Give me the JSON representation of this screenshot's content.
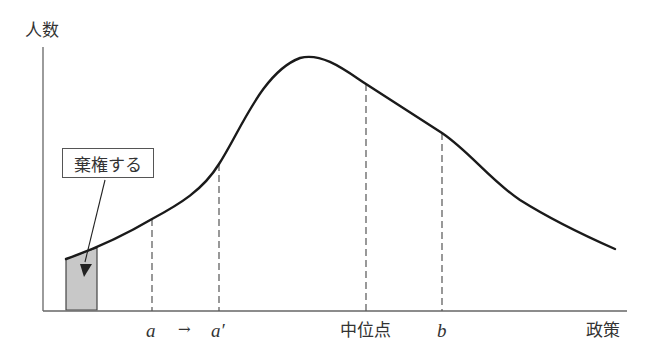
{
  "diagram": {
    "type": "distribution-curve",
    "y_axis_label": "人数",
    "x_axis_label": "政策",
    "callout_label": "棄権する",
    "markers": [
      {
        "id": "a",
        "label": "a",
        "x_px": 152,
        "curve_y_px": 219
      },
      {
        "id": "a_prime",
        "label": "a′",
        "x_px": 219,
        "curve_y_px": 164
      },
      {
        "id": "median",
        "label": "中位点",
        "x_px": 366,
        "curve_y_px": 84
      },
      {
        "id": "b",
        "label": "b",
        "x_px": 442,
        "curve_y_px": 133
      }
    ],
    "shift_arrow": "→",
    "shaded_region": {
      "description": "abstaining voters at left extreme",
      "fill": "#c8c8c8"
    },
    "colors": {
      "curve": "#1a1a1a",
      "axis": "#666666",
      "dash": "#555555",
      "shade": "#c8c8c8"
    }
  }
}
